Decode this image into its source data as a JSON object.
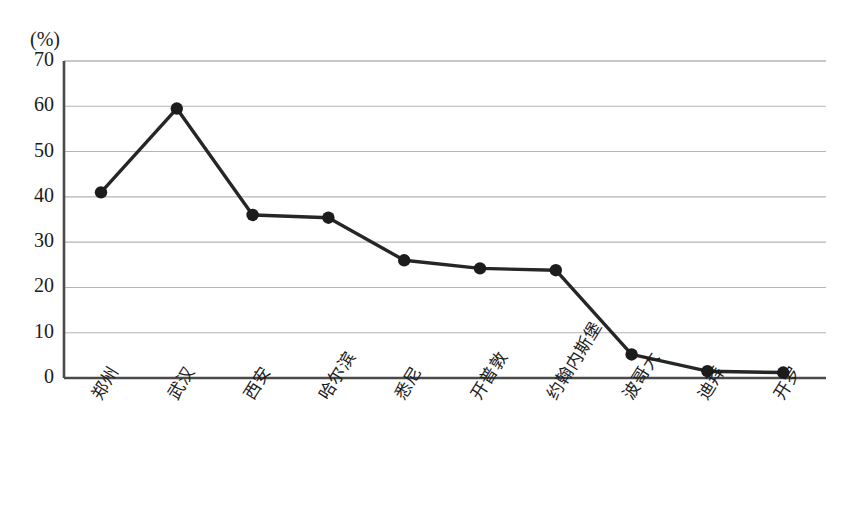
{
  "chart_data": {
    "type": "line",
    "title": "",
    "subtitle": "",
    "xlabel": "",
    "ylabel": "",
    "unit_label": "(%)",
    "categories": [
      "郑州",
      "武汉",
      "西安",
      "哈尔滨",
      "悉尼",
      "开普敦",
      "约翰内斯堡",
      "波哥大",
      "迪拜",
      "开罗"
    ],
    "values": [
      41.0,
      59.5,
      36.0,
      35.4,
      26.0,
      24.2,
      23.8,
      5.2,
      1.5,
      1.2
    ],
    "ylim": [
      0,
      70
    ],
    "ytick_labels": [
      "0",
      "10",
      "20",
      "30",
      "40",
      "50",
      "60",
      "70"
    ],
    "ytick_values": [
      0,
      10,
      20,
      30,
      40,
      50,
      60,
      70
    ],
    "grid": true,
    "grid_axis": "y",
    "legend": "none",
    "series": [
      {
        "name": "",
        "values": [
          41.0,
          59.5,
          36.0,
          35.4,
          26.0,
          24.2,
          23.8,
          5.2,
          1.5,
          1.2
        ]
      }
    ],
    "marker": "filled-circle",
    "colors": {
      "line": "#262626",
      "marker": "#1c1c1c",
      "grid": "#b4b4b4",
      "axis": "#4a4a4a",
      "background": "#ffffff",
      "text": "#1b1b1b"
    }
  }
}
